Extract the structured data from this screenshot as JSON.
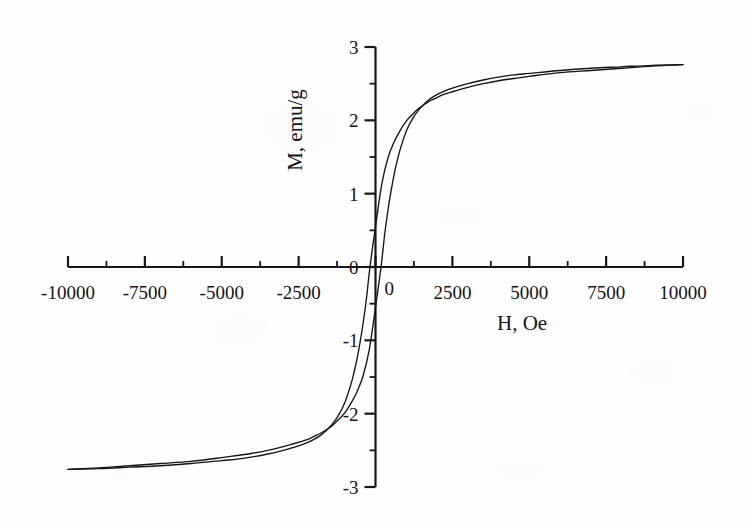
{
  "figure": {
    "kind": "magnetization-hysteresis-loop",
    "background_color": "#fefefe",
    "ink_color": "#141414"
  },
  "axes": {
    "x_title": "H, Oe",
    "y_title": "M, emu/g",
    "x_tick_labels": [
      "-10000",
      "-7500",
      "-5000",
      "-2500",
      "0",
      "2500",
      "5000",
      "7500",
      "10000"
    ],
    "y_tick_labels": [
      "3",
      "2",
      "1",
      "0",
      "-1",
      "-2",
      "-3"
    ],
    "x_origin_label": "0",
    "x_major_step": 2500,
    "x_minor_step": 1250,
    "y_major_step": 1,
    "y_minor_step": 0.5
  },
  "chart_data": {
    "type": "line",
    "title": "",
    "subtitle": "",
    "xlabel": "H, Oe",
    "ylabel": "M, emu/g",
    "xlim": [
      -10000,
      10000
    ],
    "ylim": [
      -3,
      3
    ],
    "xticks": [
      -10000,
      -7500,
      -5000,
      -2500,
      0,
      2500,
      5000,
      7500,
      10000
    ],
    "yticks": [
      -3,
      -2,
      -1,
      0,
      1,
      2,
      3
    ],
    "grid": false,
    "legend": null,
    "annotations": [],
    "saturation_magnetization": 2.76,
    "remanent_magnetization": 0.55,
    "coercive_field": 180,
    "series": [
      {
        "name": "descending branch",
        "x": [
          10000,
          9000,
          8000,
          7000,
          6000,
          5000,
          4500,
          4000,
          3500,
          3000,
          2500,
          2200,
          2000,
          1800,
          1600,
          1400,
          1200,
          1000,
          800,
          600,
          400,
          200,
          0,
          -180,
          -300,
          -400,
          -500,
          -600,
          -700,
          -800,
          -1000,
          -1200,
          -1400,
          -1600,
          -1800,
          -2000,
          -2200,
          -2500,
          -3000,
          -3500,
          -4000,
          -4500,
          -5000,
          -6000,
          -7000,
          -8000,
          -9000,
          -10000
        ],
        "y": [
          2.76,
          2.74,
          2.71,
          2.68,
          2.65,
          2.6,
          2.57,
          2.54,
          2.5,
          2.45,
          2.39,
          2.35,
          2.31,
          2.27,
          2.22,
          2.16,
          2.08,
          1.99,
          1.86,
          1.7,
          1.48,
          1.12,
          0.55,
          0.0,
          -0.45,
          -0.76,
          -1.02,
          -1.25,
          -1.44,
          -1.6,
          -1.85,
          -2.02,
          -2.14,
          -2.23,
          -2.3,
          -2.35,
          -2.39,
          -2.44,
          -2.5,
          -2.55,
          -2.59,
          -2.62,
          -2.64,
          -2.68,
          -2.71,
          -2.73,
          -2.75,
          -2.76
        ]
      },
      {
        "name": "ascending branch",
        "x": [
          -10000,
          -9000,
          -8000,
          -7000,
          -6000,
          -5000,
          -4500,
          -4000,
          -3500,
          -3000,
          -2500,
          -2200,
          -2000,
          -1800,
          -1600,
          -1400,
          -1200,
          -1000,
          -800,
          -600,
          -400,
          -200,
          0,
          180,
          300,
          400,
          500,
          600,
          700,
          800,
          1000,
          1200,
          1400,
          1600,
          1800,
          2000,
          2200,
          2500,
          3000,
          3500,
          4000,
          4500,
          5000,
          6000,
          7000,
          8000,
          9000,
          10000
        ],
        "y": [
          -2.76,
          -2.74,
          -2.71,
          -2.68,
          -2.65,
          -2.6,
          -2.57,
          -2.54,
          -2.5,
          -2.45,
          -2.39,
          -2.35,
          -2.31,
          -2.27,
          -2.22,
          -2.16,
          -2.08,
          -1.99,
          -1.86,
          -1.7,
          -1.48,
          -1.12,
          -0.55,
          0.0,
          0.45,
          0.76,
          1.02,
          1.25,
          1.44,
          1.6,
          1.85,
          2.02,
          2.14,
          2.23,
          2.3,
          2.35,
          2.39,
          2.44,
          2.5,
          2.55,
          2.59,
          2.62,
          2.64,
          2.68,
          2.71,
          2.73,
          2.75,
          2.76
        ]
      }
    ]
  }
}
